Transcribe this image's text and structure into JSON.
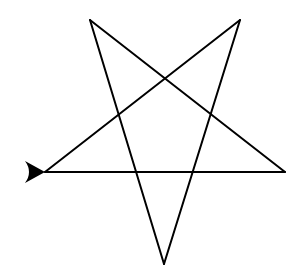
{
  "canvas": {
    "background": "#ffffff",
    "pen_color": "#000000",
    "drawing": "pentagram",
    "vertices": [
      {
        "name": "start-left",
        "x": 45,
        "y": 172
      },
      {
        "name": "right",
        "x": 285,
        "y": 172
      },
      {
        "name": "top-left",
        "x": 90,
        "y": 20
      },
      {
        "name": "bottom",
        "x": 164,
        "y": 264
      },
      {
        "name": "top-right",
        "x": 240,
        "y": 20
      },
      {
        "name": "end-left",
        "x": 45,
        "y": 172
      }
    ],
    "turtle": {
      "icon": "turtle-arrow-icon",
      "heading_degrees": 0,
      "color": "#000000"
    }
  }
}
